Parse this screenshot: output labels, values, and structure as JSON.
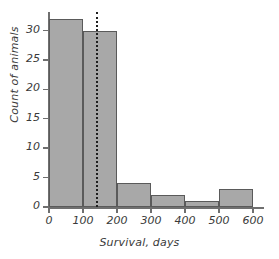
{
  "chart_data": {
    "type": "bar",
    "title": "",
    "subtitle": "",
    "xlabel": "Survival, days",
    "ylabel": "Count of animals",
    "xlim": [
      0,
      620
    ],
    "ylim": [
      0,
      33
    ],
    "grid": false,
    "legend": null,
    "bin_width": 100,
    "bin_edges": [
      0,
      100,
      200,
      300,
      400,
      500,
      600
    ],
    "categories": [
      "0-100",
      "100-200",
      "200-300",
      "300-400",
      "400-500",
      "500-600"
    ],
    "values": [
      32,
      30,
      4,
      2,
      1,
      3
    ],
    "xticks": [
      0,
      100,
      200,
      300,
      400,
      500,
      600
    ],
    "xtick_labels": [
      "0",
      "100",
      "200",
      "300",
      "400",
      "500",
      "600"
    ],
    "yticks": [
      0,
      5,
      10,
      15,
      20,
      25,
      30
    ],
    "ytick_labels": [
      "0",
      "5",
      "10",
      "15",
      "20",
      "25",
      "30"
    ],
    "annotations": [
      {
        "name": "mean-reference-line",
        "type": "vline",
        "x": 140,
        "style": "dotted",
        "color": "#1f1f1f",
        "label": ""
      }
    ],
    "colors": {
      "bar_fill": "#a8a8a8",
      "bar_edge": "#5a5a5a",
      "axis": "#6f6f6f",
      "text": "#3a3a3a",
      "reference_line": "#1f1f1f",
      "background": "#ffffff"
    }
  }
}
